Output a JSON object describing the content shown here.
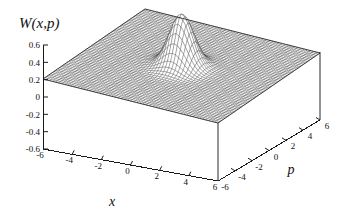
{
  "chart_data": {
    "type": "surface",
    "title": "W(x,p)",
    "xlabel": "x",
    "ylabel": "p",
    "zlabel": "W(x,p)",
    "xlim": [
      -6,
      6
    ],
    "ylim": [
      -6,
      6
    ],
    "zlim": [
      -0.6,
      0.6
    ],
    "x_ticks": [
      "-6",
      "-4",
      "-2",
      "0",
      "2",
      "4",
      "6"
    ],
    "x_tick_values": [
      -6,
      -4,
      -2,
      0,
      2,
      4,
      6
    ],
    "p_ticks": [
      "-6",
      "-4",
      "-2",
      "0",
      "2",
      "4",
      "6"
    ],
    "p_tick_values": [
      -6,
      -4,
      -2,
      0,
      2,
      4,
      6
    ],
    "z_ticks": [
      "0.6",
      "0.4",
      "0.2",
      "0",
      "-0.2",
      "-0.4",
      "-0.6"
    ],
    "z_tick_values": [
      0.6,
      0.4,
      0.2,
      0,
      -0.2,
      -0.4,
      -0.6
    ],
    "grid": false,
    "legend": "none",
    "surface_style": "wireframe-mesh",
    "mesh_color": "#333333",
    "surface_fill": "#ffffff",
    "background": "#ffffff",
    "projection": {
      "rotation_x_deg": 60,
      "rotation_z_deg": 30,
      "hidden_line_removal": true
    },
    "function": {
      "description": "Gaussian peak centred at origin on a flat zero plane",
      "form": "W(x,p) = A * exp(-(x^2 + p^2) / (2 * sigma^2))",
      "amplitude": 0.6,
      "sigma": 0.75,
      "center_x": 0,
      "center_p": 0,
      "peak_value": 0.6,
      "baseline_value": 0.0,
      "min_value": 0.0,
      "grid_resolution": 61
    },
    "annotations": []
  },
  "figure": {
    "title_text": "W(x,p)",
    "x_axis_label": "x",
    "p_axis_label": "p"
  }
}
